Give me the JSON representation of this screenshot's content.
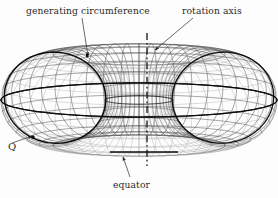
{
  "figure": {
    "background_color": "#fdfdfd",
    "line_color": "#3a3a3a",
    "bold_line_color": "#111111",
    "width": 278,
    "height": 198
  },
  "labels": {
    "generating_circumference": "generating circumference",
    "rotation_axis": "rotation axis",
    "equator": "equator",
    "point_q": "Q"
  },
  "geometry": {
    "center_x": 139,
    "center_y": 100,
    "major_radius": 86,
    "minor_radius": 52,
    "tilt_degrees": 72,
    "meridian_count": 48,
    "parallel_count": 24,
    "equator_y": 152,
    "axis_x": 147,
    "axis_top_y": 33,
    "axis_bottom_y": 166,
    "q_point_x": 33,
    "q_point_y": 137,
    "generating_circle_center_x": 86,
    "generating_circle_center_y": 107,
    "generating_circle_rx": 51,
    "generating_circle_ry": 46
  },
  "annotations": [
    {
      "name": "generating-circumference-leader",
      "text": "generating circumference",
      "from_x": 82,
      "from_y": 18,
      "to_x": 88,
      "to_y": 56
    },
    {
      "name": "rotation-axis-leader",
      "text": "rotation axis",
      "from_x": 193,
      "from_y": 18,
      "to_x": 155,
      "to_y": 50
    },
    {
      "name": "equator-leader",
      "text": "equator",
      "from_x": 130,
      "from_y": 177,
      "to_x": 123,
      "to_y": 157
    },
    {
      "name": "point-q-leader",
      "text": "Q",
      "from_x": 12,
      "from_y": 143,
      "to_x": 32,
      "to_y": 136
    }
  ]
}
